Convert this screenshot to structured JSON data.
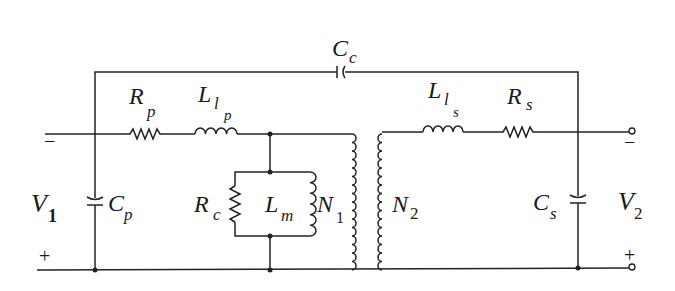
{
  "diagram": {
    "type": "transformer-equivalent-circuit",
    "labels": {
      "Cc": {
        "main": "C",
        "sub": "c"
      },
      "Rp": {
        "main": "R",
        "sub": "p"
      },
      "Llp": {
        "main": "L",
        "sub": "l",
        "subsub": "p"
      },
      "Lls": {
        "main": "L",
        "sub": "l",
        "subsub": "s"
      },
      "Rs": {
        "main": "R",
        "sub": "s"
      },
      "V1": {
        "main": "V",
        "sub": "1"
      },
      "V2": {
        "main": "V",
        "sub": "2"
      },
      "Cp": {
        "main": "C",
        "sub": "p"
      },
      "Cs": {
        "main": "C",
        "sub": "s"
      },
      "Rc": {
        "main": "R",
        "sub": "c"
      },
      "Lm": {
        "main": "L",
        "sub": "m"
      },
      "N1": {
        "main": "N",
        "sub": "1"
      },
      "N2": {
        "main": "N",
        "sub": "2"
      }
    },
    "polarity": {
      "v1_top": "−",
      "v1_bottom": "+",
      "v2_top": "−",
      "v2_bottom": "+"
    },
    "colors": {
      "stroke": "#222222",
      "background": "#ffffff"
    }
  }
}
